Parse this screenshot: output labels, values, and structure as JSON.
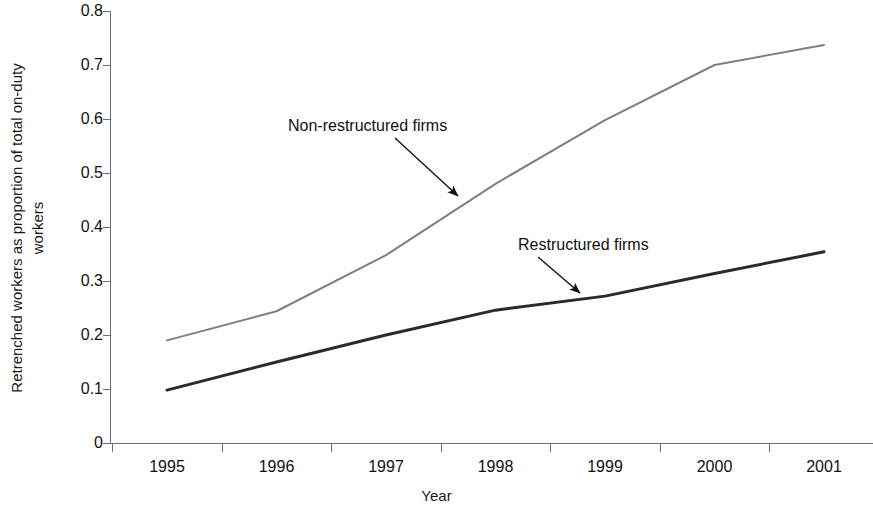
{
  "chart_data": {
    "type": "line",
    "title": "",
    "xlabel": "Year",
    "ylabel": "Retrenched workers as proportion of total on-duty workers",
    "ylabel_lines": [
      "Retrenched workers as proportion of total on-duty",
      "workers"
    ],
    "categories": [
      "1995",
      "1996",
      "1997",
      "1998",
      "1999",
      "2000",
      "2001"
    ],
    "x": [
      1995,
      1996,
      1997,
      1998,
      1999,
      2000,
      2001
    ],
    "xlim": [
      1995,
      2001
    ],
    "ylim": [
      0,
      0.8
    ],
    "yticks": [
      "0",
      "0.1",
      "0.2",
      "0.3",
      "0.4",
      "0.5",
      "0.6",
      "0.7",
      "0.8"
    ],
    "ytick_values": [
      0,
      0.1,
      0.2,
      0.3,
      0.4,
      0.5,
      0.6,
      0.7,
      0.8
    ],
    "grid": false,
    "legend": "none",
    "series": [
      {
        "name": "Non-restructured firms",
        "color": "#7f7f7f",
        "width": 2,
        "values": [
          0.19,
          0.244,
          0.348,
          0.48,
          0.598,
          0.7,
          0.737
        ]
      },
      {
        "name": "Restructured firms",
        "color": "#2a2a2a",
        "width": 3,
        "values": [
          0.098,
          0.15,
          0.2,
          0.246,
          0.272,
          0.314,
          0.354
        ]
      }
    ],
    "annotations": [
      {
        "text": "Non-restructured firms",
        "target_series": "Non-restructured firms",
        "label_x": 288,
        "label_y": 117,
        "arrow_from_x": 395,
        "arrow_from_y": 138,
        "arrow_to_x": 458,
        "arrow_to_y": 196
      },
      {
        "text": "Restructured firms",
        "target_series": "Restructured firms",
        "label_x": 518,
        "label_y": 236,
        "arrow_from_x": 538,
        "arrow_from_y": 257,
        "arrow_to_x": 580,
        "arrow_to_y": 293
      }
    ]
  },
  "colors": {
    "background": "#ffffff",
    "axis": "#6e6e6e",
    "text": "#111111",
    "series_non_restructured": "#7f7f7f",
    "series_restructured": "#2a2a2a"
  }
}
